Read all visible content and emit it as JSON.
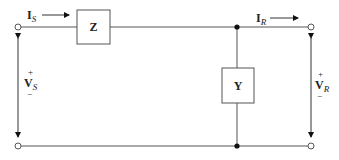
{
  "diagram": {
    "type": "two-port network (L-section equivalent circuit)",
    "series_element": {
      "label": "Z"
    },
    "shunt_element": {
      "label": "Y"
    },
    "currents": {
      "sending": {
        "symbol": "I",
        "subscript": "S"
      },
      "receiving": {
        "symbol": "I",
        "subscript": "R"
      }
    },
    "voltages": {
      "sending": {
        "symbol": "V",
        "subscript": "S",
        "plus": "+",
        "minus": "−"
      },
      "receiving": {
        "symbol": "V",
        "subscript": "R",
        "plus": "+",
        "minus": "−"
      }
    },
    "colors": {
      "wire": "#555555",
      "node": "#111111",
      "background": "#ffffff"
    }
  }
}
